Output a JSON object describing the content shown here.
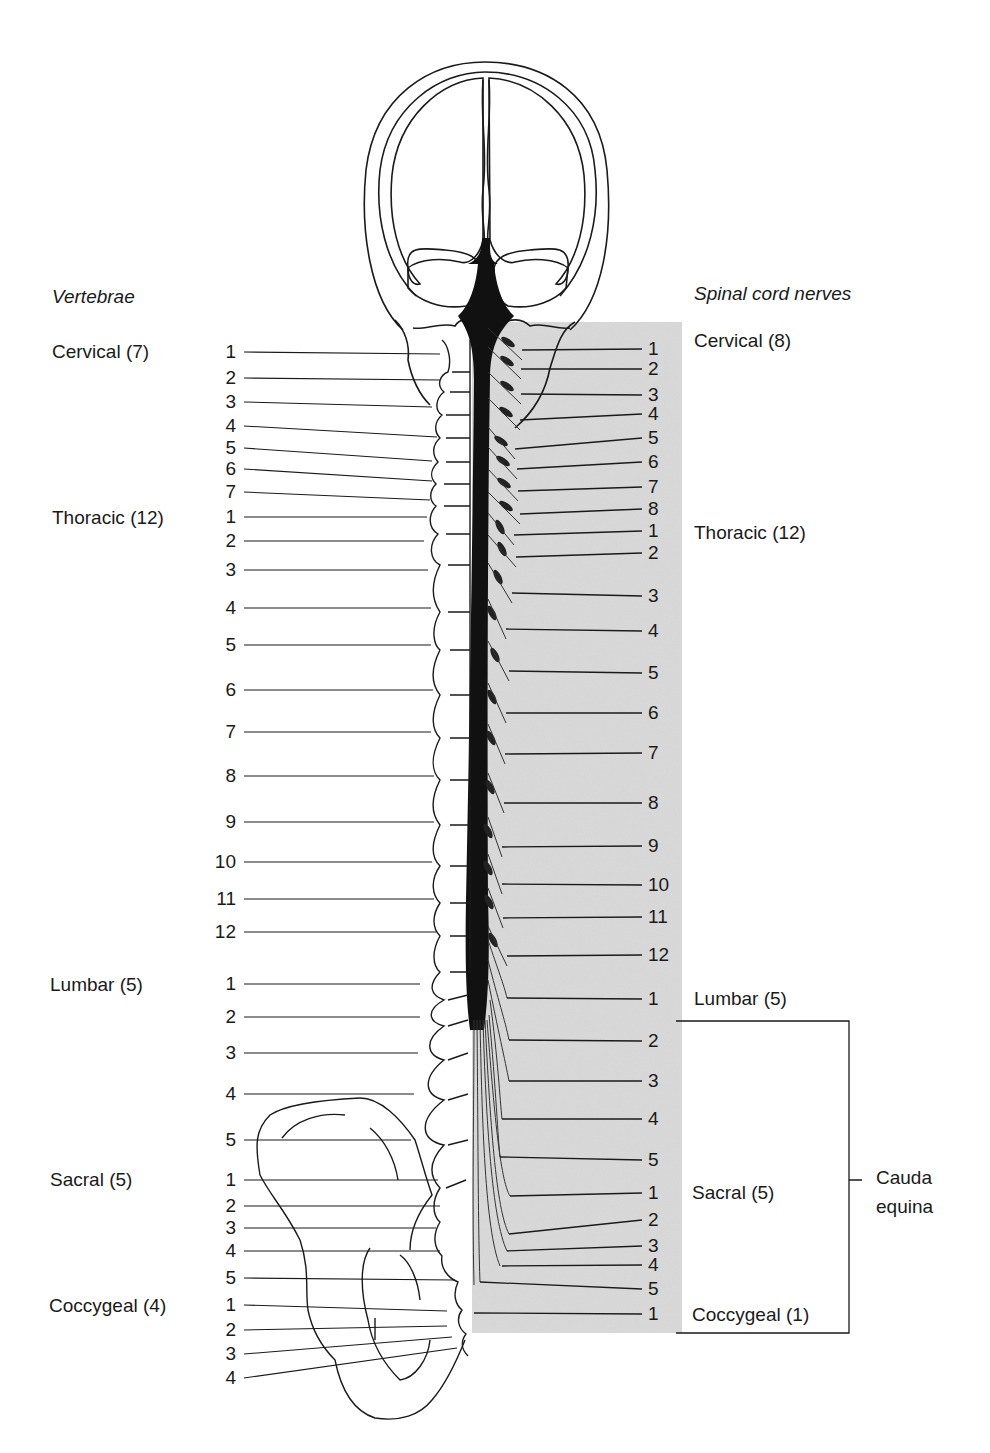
{
  "headers": {
    "vertebrae": "Vertebrae",
    "nerves": "Spinal cord nerves"
  },
  "vertebrae_groups": [
    {
      "label": "Cervical (7)",
      "y": 342
    },
    {
      "label": "Thoracic (12)",
      "y": 518
    },
    {
      "label": "Lumbar (5)",
      "y": 984
    },
    {
      "label": "Sacral (5)",
      "y": 1180
    },
    {
      "label": "Coccygeal (4)",
      "y": 1306
    }
  ],
  "nerve_groups": [
    {
      "label": "Cervical (8)",
      "y": 341
    },
    {
      "label": "Thoracic (12)",
      "y": 533
    },
    {
      "label": "Lumbar (5)",
      "y": 999
    },
    {
      "label": "Sacral (5)",
      "y": 1193
    },
    {
      "label": "Coccygeal (1)",
      "y": 1315
    }
  ],
  "cauda_equina": {
    "label_line1": "Cauda",
    "label_line2": "equina",
    "bracket_top": 1021,
    "bracket_bottom": 1333,
    "bracket_x": 849
  },
  "vertebrae_numbers": [
    {
      "n": "1",
      "y": 352,
      "tx": 440,
      "ty": 354
    },
    {
      "n": "2",
      "y": 378,
      "tx": 440,
      "ty": 380
    },
    {
      "n": "3",
      "y": 402,
      "tx": 432,
      "ty": 407
    },
    {
      "n": "4",
      "y": 426,
      "tx": 437,
      "ty": 437
    },
    {
      "n": "5",
      "y": 448,
      "tx": 432,
      "ty": 461
    },
    {
      "n": "6",
      "y": 469,
      "tx": 432,
      "ty": 481
    },
    {
      "n": "7",
      "y": 492,
      "tx": 430,
      "ty": 500
    },
    {
      "n": "1",
      "y": 517,
      "tx": 427,
      "ty": 517
    },
    {
      "n": "2",
      "y": 541,
      "tx": 424,
      "ty": 541
    },
    {
      "n": "3",
      "y": 570,
      "tx": 428,
      "ty": 570
    },
    {
      "n": "4",
      "y": 608,
      "tx": 431,
      "ty": 608
    },
    {
      "n": "5",
      "y": 645,
      "tx": 431,
      "ty": 645
    },
    {
      "n": "6",
      "y": 690,
      "tx": 433,
      "ty": 690
    },
    {
      "n": "7",
      "y": 732,
      "tx": 431,
      "ty": 732
    },
    {
      "n": "8",
      "y": 776,
      "tx": 434,
      "ty": 776
    },
    {
      "n": "9",
      "y": 822,
      "tx": 434,
      "ty": 822
    },
    {
      "n": "10",
      "y": 862,
      "tx": 432,
      "ty": 862
    },
    {
      "n": "11",
      "y": 899,
      "tx": 434,
      "ty": 899
    },
    {
      "n": "12",
      "y": 932,
      "tx": 436,
      "ty": 932
    },
    {
      "n": "1",
      "y": 984,
      "tx": 420,
      "ty": 984
    },
    {
      "n": "2",
      "y": 1017,
      "tx": 420,
      "ty": 1017
    },
    {
      "n": "3",
      "y": 1053,
      "tx": 418,
      "ty": 1053
    },
    {
      "n": "4",
      "y": 1094,
      "tx": 414,
      "ty": 1094
    },
    {
      "n": "5",
      "y": 1140,
      "tx": 411,
      "ty": 1140
    },
    {
      "n": "1",
      "y": 1180,
      "tx": 438,
      "ty": 1180
    },
    {
      "n": "2",
      "y": 1206,
      "tx": 440,
      "ty": 1206
    },
    {
      "n": "3",
      "y": 1228,
      "tx": 436,
      "ty": 1228
    },
    {
      "n": "4",
      "y": 1251,
      "tx": 440,
      "ty": 1251
    },
    {
      "n": "5",
      "y": 1278,
      "tx": 455,
      "ty": 1280
    },
    {
      "n": "1",
      "y": 1305,
      "tx": 447,
      "ty": 1311
    },
    {
      "n": "2",
      "y": 1330,
      "tx": 447,
      "ty": 1326
    },
    {
      "n": "3",
      "y": 1354,
      "tx": 452,
      "ty": 1337
    },
    {
      "n": "4",
      "y": 1378,
      "tx": 457,
      "ty": 1348
    }
  ],
  "nerve_numbers": [
    {
      "n": "1",
      "y": 349,
      "sx": 522,
      "sy": 350
    },
    {
      "n": "2",
      "y": 369,
      "sx": 521,
      "sy": 369
    },
    {
      "n": "3",
      "y": 395,
      "sx": 521,
      "sy": 394
    },
    {
      "n": "4",
      "y": 414,
      "sx": 520,
      "sy": 420
    },
    {
      "n": "5",
      "y": 438,
      "sx": 515,
      "sy": 449
    },
    {
      "n": "6",
      "y": 462,
      "sx": 517,
      "sy": 469
    },
    {
      "n": "7",
      "y": 487,
      "sx": 518,
      "sy": 491
    },
    {
      "n": "8",
      "y": 509,
      "sx": 520,
      "sy": 514
    },
    {
      "n": "1",
      "y": 531,
      "sx": 514,
      "sy": 535
    },
    {
      "n": "2",
      "y": 553,
      "sx": 516,
      "sy": 557
    },
    {
      "n": "3",
      "y": 596,
      "sx": 512,
      "sy": 593
    },
    {
      "n": "4",
      "y": 631,
      "sx": 506,
      "sy": 629
    },
    {
      "n": "5",
      "y": 673,
      "sx": 509,
      "sy": 671
    },
    {
      "n": "6",
      "y": 713,
      "sx": 506,
      "sy": 713
    },
    {
      "n": "7",
      "y": 753,
      "sx": 505,
      "sy": 754
    },
    {
      "n": "8",
      "y": 803,
      "sx": 504,
      "sy": 803
    },
    {
      "n": "9",
      "y": 846,
      "sx": 502,
      "sy": 847
    },
    {
      "n": "10",
      "y": 885,
      "sx": 502,
      "sy": 884
    },
    {
      "n": "11",
      "y": 917,
      "sx": 503,
      "sy": 918
    },
    {
      "n": "12",
      "y": 955,
      "sx": 507,
      "sy": 956
    },
    {
      "n": "1",
      "y": 999,
      "sx": 507,
      "sy": 998
    },
    {
      "n": "2",
      "y": 1041,
      "sx": 509,
      "sy": 1040
    },
    {
      "n": "3",
      "y": 1081,
      "sx": 509,
      "sy": 1081
    },
    {
      "n": "4",
      "y": 1119,
      "sx": 502,
      "sy": 1119
    },
    {
      "n": "5",
      "y": 1160,
      "sx": 500,
      "sy": 1157
    },
    {
      "n": "1",
      "y": 1193,
      "sx": 510,
      "sy": 1196
    },
    {
      "n": "2",
      "y": 1220,
      "sx": 509,
      "sy": 1234
    },
    {
      "n": "3",
      "y": 1246,
      "sx": 507,
      "sy": 1251
    },
    {
      "n": "4",
      "y": 1265,
      "sx": 502,
      "sy": 1266
    },
    {
      "n": "5",
      "y": 1289,
      "sx": 480,
      "sy": 1282
    },
    {
      "n": "1",
      "y": 1314,
      "sx": 474,
      "sy": 1313
    }
  ],
  "colors": {
    "ink": "#1a1a1a",
    "cord": "#111111",
    "panel": "#d9d9d9"
  }
}
